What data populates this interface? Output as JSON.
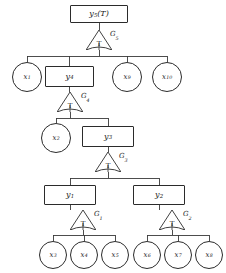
{
  "diagram": {
    "type": "fault-tree",
    "title": "",
    "nodes": [
      {
        "id": "y5",
        "kind": "box",
        "label_base": "y",
        "label_sub": "5",
        "label_suffix": "(T)",
        "x": 70,
        "y": 5,
        "w": 58,
        "h": 18
      },
      {
        "id": "x1",
        "kind": "circle",
        "label_base": "x",
        "label_sub": "1",
        "label_suffix": "",
        "x": 12,
        "y": 62,
        "w": 30,
        "h": 30
      },
      {
        "id": "y4",
        "kind": "box",
        "label_base": "y",
        "label_sub": "4",
        "label_suffix": "",
        "x": 45,
        "y": 66,
        "w": 49,
        "h": 21
      },
      {
        "id": "x9",
        "kind": "circle",
        "label_base": "x",
        "label_sub": "9",
        "label_suffix": "",
        "x": 112,
        "y": 62,
        "w": 30,
        "h": 30
      },
      {
        "id": "x10",
        "kind": "circle",
        "label_base": "x",
        "label_sub": "10",
        "label_suffix": "",
        "x": 152,
        "y": 62,
        "w": 30,
        "h": 30
      },
      {
        "id": "x2",
        "kind": "circle",
        "label_base": "x",
        "label_sub": "2",
        "label_suffix": "",
        "x": 41,
        "y": 123,
        "w": 30,
        "h": 30
      },
      {
        "id": "y3",
        "kind": "box",
        "label_base": "y",
        "label_sub": "3",
        "label_suffix": "",
        "x": 82,
        "y": 126,
        "w": 52,
        "h": 21
      },
      {
        "id": "y1",
        "kind": "box",
        "label_base": "y",
        "label_sub": "1",
        "label_suffix": "",
        "x": 44,
        "y": 185,
        "w": 52,
        "h": 20
      },
      {
        "id": "y2",
        "kind": "box",
        "label_base": "y",
        "label_sub": "2",
        "label_suffix": "",
        "x": 133,
        "y": 185,
        "w": 52,
        "h": 20
      },
      {
        "id": "x3",
        "kind": "circle",
        "label_base": "x",
        "label_sub": "3",
        "label_suffix": "",
        "x": 39,
        "y": 241,
        "w": 28,
        "h": 28
      },
      {
        "id": "x4",
        "kind": "circle",
        "label_base": "x",
        "label_sub": "4",
        "label_suffix": "",
        "x": 70,
        "y": 241,
        "w": 28,
        "h": 28
      },
      {
        "id": "x5",
        "kind": "circle",
        "label_base": "x",
        "label_sub": "5",
        "label_suffix": "",
        "x": 101,
        "y": 241,
        "w": 28,
        "h": 28
      },
      {
        "id": "x6",
        "kind": "circle",
        "label_base": "x",
        "label_sub": "6",
        "label_suffix": "",
        "x": 133,
        "y": 241,
        "w": 28,
        "h": 28
      },
      {
        "id": "x7",
        "kind": "circle",
        "label_base": "x",
        "label_sub": "7",
        "label_suffix": "",
        "x": 164,
        "y": 241,
        "w": 28,
        "h": 28
      },
      {
        "id": "x8",
        "kind": "circle",
        "label_base": "x",
        "label_sub": "8",
        "label_suffix": "",
        "x": 195,
        "y": 241,
        "w": 28,
        "h": 28
      }
    ],
    "gates": [
      {
        "id": "G5",
        "letter": "T",
        "label_base": "G",
        "label_sub": "5",
        "x": 86,
        "y": 30,
        "label_x": 110,
        "label_y": 31
      },
      {
        "id": "G4",
        "letter": "T",
        "label_base": "G",
        "label_sub": "4",
        "x": 57,
        "y": 92,
        "label_x": 81,
        "label_y": 93
      },
      {
        "id": "G3",
        "letter": "T",
        "label_base": "G",
        "label_sub": "3",
        "x": 95,
        "y": 152,
        "label_x": 119,
        "label_y": 153
      },
      {
        "id": "G1",
        "letter": "T",
        "label_base": "G",
        "label_sub": "1",
        "x": 70,
        "y": 210,
        "label_x": 94,
        "label_y": 211
      },
      {
        "id": "G2",
        "letter": "T",
        "label_base": "G",
        "label_sub": "2",
        "x": 159,
        "y": 210,
        "label_x": 183,
        "label_y": 211
      }
    ],
    "edges": {
      "stroke": "#3a3a3a",
      "stroke_width": 0.9,
      "segments": [
        "M99,23 L99,30",
        "M99,50 L99,56",
        "M27,56 L167,56",
        "M27,56 L27,62",
        "M69.5,56 L69.5,66",
        "M127,56 L127,62",
        "M167,56 L167,62",
        "M69.5,87 L69.5,92",
        "M70,112 L70,118",
        "M56,118 L108,118",
        "M56,118 L56,123",
        "M108,118 L108,126",
        "M108,147 L108,152",
        "M108,172 L108,178",
        "M70,178 L159,178",
        "M70,178 L70,185",
        "M159,178 L159,185",
        "M70,205 L70,210",
        "M159,205 L159,210",
        "M83,230 L83,235",
        "M53,235 L115,235",
        "M53,235 L53,241",
        "M84,235 L84,241",
        "M115,235 L115,241",
        "M172,230 L172,235",
        "M147,235 L209,235",
        "M147,235 L147,241",
        "M178,235 L178,241",
        "M209,235 L209,241"
      ]
    }
  }
}
